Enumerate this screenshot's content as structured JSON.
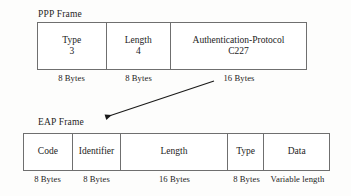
{
  "diagram": {
    "background_color": "#fdfdfc",
    "line_color": "#6f6f6f",
    "text_color": "#1c1c1c"
  },
  "ppp_frame": {
    "label": "PPP Frame",
    "fields": [
      {
        "name": "Type",
        "value": "3",
        "size": "8 Bytes"
      },
      {
        "name": "Length",
        "value": "4",
        "size": "8 Bytes"
      },
      {
        "name": "Authentication-Protocol",
        "value": "C227",
        "size": "16 Bytes"
      }
    ]
  },
  "eap_frame": {
    "label": "EAP Frame",
    "fields": [
      {
        "name": "Code",
        "value": "",
        "size": "8 Bytes"
      },
      {
        "name": "Identifier",
        "value": "",
        "size": "8 Bytes"
      },
      {
        "name": "Length",
        "value": "",
        "size": "16 Bytes"
      },
      {
        "name": "Type",
        "value": "",
        "size": "8 Bytes"
      },
      {
        "name": "Data",
        "value": "",
        "size": "Variable length"
      }
    ]
  },
  "connector": {
    "name": "expansion-arrow",
    "from_label": "Authentication-Protocol field",
    "to_label": "EAP Frame"
  }
}
